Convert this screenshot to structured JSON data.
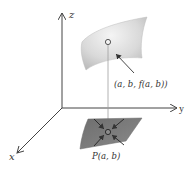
{
  "figure": {
    "axes": {
      "z_label": "z",
      "y_label": "y",
      "x_label": "x"
    },
    "surface_point_label": "(a, b, f(a, b))",
    "domain_point_label": "P(a, b)",
    "colors": {
      "axis": "#444444",
      "surface_light": "#e6e6e6",
      "surface_mid": "#c4c4c4",
      "domain_patch": "#7d7d7d",
      "guide_line": "#9a9a9a",
      "text": "#333333"
    }
  }
}
